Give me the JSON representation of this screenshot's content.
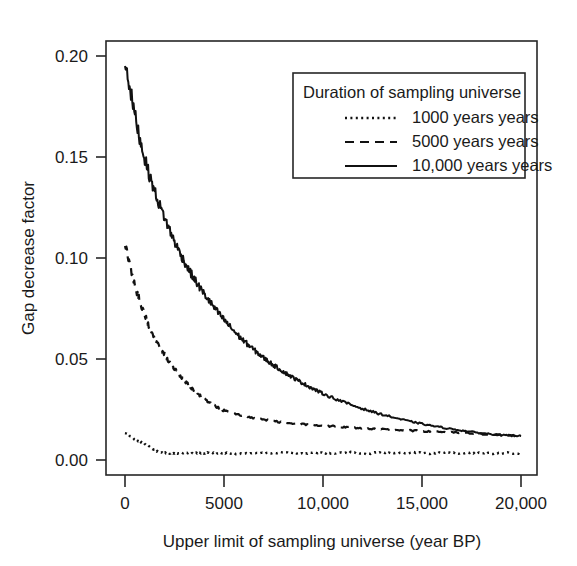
{
  "chart_data": {
    "type": "line",
    "title": "",
    "xlabel": "Upper limit of sampling universe (year BP)",
    "ylabel": "Gap decrease factor",
    "xlim": [
      -600,
      20600
    ],
    "ylim": [
      -0.006,
      0.207
    ],
    "xticks": [
      0,
      5000,
      10000,
      15000,
      20000
    ],
    "xticklabels": [
      "0",
      "5000",
      "10,000",
      "15,000",
      "20,000"
    ],
    "yticks": [
      0.0,
      0.05,
      0.1,
      0.15,
      0.2
    ],
    "yticklabels": [
      "0.00",
      "0.05",
      "0.10",
      "0.15",
      "0.20"
    ],
    "grid": false,
    "legend_position": "top-right",
    "legend_title": "Duration of sampling universe",
    "series": [
      {
        "name": "1000 years",
        "style": "dotted",
        "x": [
          0,
          200,
          400,
          600,
          800,
          1000,
          1200,
          1400,
          1600,
          1800,
          2000,
          2200,
          2400,
          2600,
          2800,
          3000,
          3200,
          3400,
          3600,
          3800,
          4000,
          4200,
          4400,
          4600,
          4800,
          5000,
          5400,
          5800,
          6200,
          6600,
          7000,
          7400,
          7800,
          8200,
          8600,
          9000,
          9400,
          9800,
          10200,
          10600,
          11000,
          11400,
          11800,
          12200,
          12600,
          13000,
          13400,
          13800,
          14200,
          14600,
          15000,
          15400,
          15800,
          16200,
          16600,
          17000,
          17400,
          17800,
          18200,
          18600,
          19000,
          19400,
          19800,
          20000
        ],
        "y": [
          0.0132,
          0.0122,
          0.0108,
          0.0098,
          0.0089,
          0.0082,
          0.0068,
          0.0054,
          0.0043,
          0.0037,
          0.0036,
          0.0034,
          0.0035,
          0.0033,
          0.0034,
          0.0036,
          0.0034,
          0.0033,
          0.0035,
          0.0036,
          0.0034,
          0.0036,
          0.0035,
          0.0033,
          0.0034,
          0.0036,
          0.0033,
          0.0031,
          0.0034,
          0.0037,
          0.0035,
          0.0033,
          0.0036,
          0.0038,
          0.0034,
          0.0032,
          0.0035,
          0.0037,
          0.0034,
          0.0032,
          0.0036,
          0.0038,
          0.0033,
          0.0031,
          0.0035,
          0.0037,
          0.0034,
          0.0032,
          0.0035,
          0.0038,
          0.0035,
          0.0032,
          0.0034,
          0.0037,
          0.0035,
          0.0033,
          0.0035,
          0.0036,
          0.0034,
          0.0033,
          0.0034,
          0.0035,
          0.0033,
          0.0033
        ]
      },
      {
        "name": "5000 years",
        "style": "dashed",
        "x": [
          0,
          200,
          400,
          600,
          800,
          1000,
          1200,
          1400,
          1600,
          1800,
          2000,
          2200,
          2400,
          2600,
          2800,
          3000,
          3200,
          3400,
          3600,
          3800,
          4000,
          4200,
          4400,
          4600,
          4800,
          5000,
          5400,
          5800,
          6200,
          6600,
          7000,
          7400,
          7800,
          8200,
          8600,
          9000,
          9400,
          9800,
          10200,
          10600,
          11000,
          11400,
          11800,
          12200,
          12600,
          13000,
          13400,
          13800,
          14200,
          14600,
          15000,
          15400,
          15800,
          16200,
          16600,
          17000,
          17400,
          17800,
          18200,
          18600,
          19000,
          19400,
          19800,
          20000
        ],
        "y": [
          0.1068,
          0.098,
          0.09,
          0.0832,
          0.0772,
          0.0718,
          0.0668,
          0.0622,
          0.058,
          0.0548,
          0.052,
          0.0492,
          0.0464,
          0.0438,
          0.0414,
          0.0392,
          0.0372,
          0.0352,
          0.0334,
          0.0318,
          0.0302,
          0.0288,
          0.0275,
          0.0264,
          0.0254,
          0.0245,
          0.0232,
          0.0222,
          0.0214,
          0.0206,
          0.02,
          0.0194,
          0.0188,
          0.0184,
          0.018,
          0.0177,
          0.0174,
          0.0171,
          0.0168,
          0.0166,
          0.0163,
          0.0161,
          0.0158,
          0.0156,
          0.0154,
          0.0152,
          0.015,
          0.0148,
          0.0147,
          0.0145,
          0.0143,
          0.0141,
          0.014,
          0.0138,
          0.0136,
          0.0134,
          0.0132,
          0.013,
          0.0128,
          0.0126,
          0.0124,
          0.0122,
          0.012,
          0.0119
        ]
      },
      {
        "name": "10,000 years",
        "style": "solid",
        "x": [
          0,
          200,
          400,
          600,
          800,
          1000,
          1200,
          1400,
          1600,
          1800,
          2000,
          2200,
          2400,
          2600,
          2800,
          3000,
          3200,
          3400,
          3600,
          3800,
          4000,
          4200,
          4400,
          4600,
          4800,
          5000,
          5200,
          5400,
          5600,
          5800,
          6000,
          6200,
          6400,
          6600,
          6800,
          7000,
          7200,
          7400,
          7600,
          7800,
          8000,
          8200,
          8400,
          8600,
          8800,
          9000,
          9200,
          9400,
          9600,
          9800,
          10000,
          10400,
          10800,
          11200,
          11600,
          12000,
          12400,
          12800,
          13200,
          13600,
          14000,
          14400,
          14800,
          15200,
          15600,
          16000,
          16400,
          16800,
          17200,
          17600,
          18000,
          18400,
          18800,
          19200,
          19600,
          20000
        ],
        "y": [
          0.1975,
          0.187,
          0.176,
          0.166,
          0.157,
          0.149,
          0.142,
          0.136,
          0.13,
          0.1248,
          0.12,
          0.115,
          0.1105,
          0.106,
          0.102,
          0.0982,
          0.0945,
          0.0912,
          0.088,
          0.085,
          0.0822,
          0.0795,
          0.0768,
          0.0742,
          0.0718,
          0.0695,
          0.0672,
          0.065,
          0.0628,
          0.0608,
          0.059,
          0.0572,
          0.0555,
          0.0538,
          0.0522,
          0.0506,
          0.0491,
          0.0477,
          0.0463,
          0.045,
          0.0437,
          0.0425,
          0.0413,
          0.0401,
          0.039,
          0.0379,
          0.0368,
          0.0358,
          0.0348,
          0.0338,
          0.0329,
          0.0312,
          0.0296,
          0.0281,
          0.0267,
          0.0254,
          0.0242,
          0.023,
          0.022,
          0.021,
          0.02,
          0.0191,
          0.0183,
          0.0175,
          0.0168,
          0.0161,
          0.0155,
          0.0149,
          0.0143,
          0.0138,
          0.0133,
          0.0129,
          0.0125,
          0.0122,
          0.012,
          0.0119
        ]
      }
    ]
  }
}
